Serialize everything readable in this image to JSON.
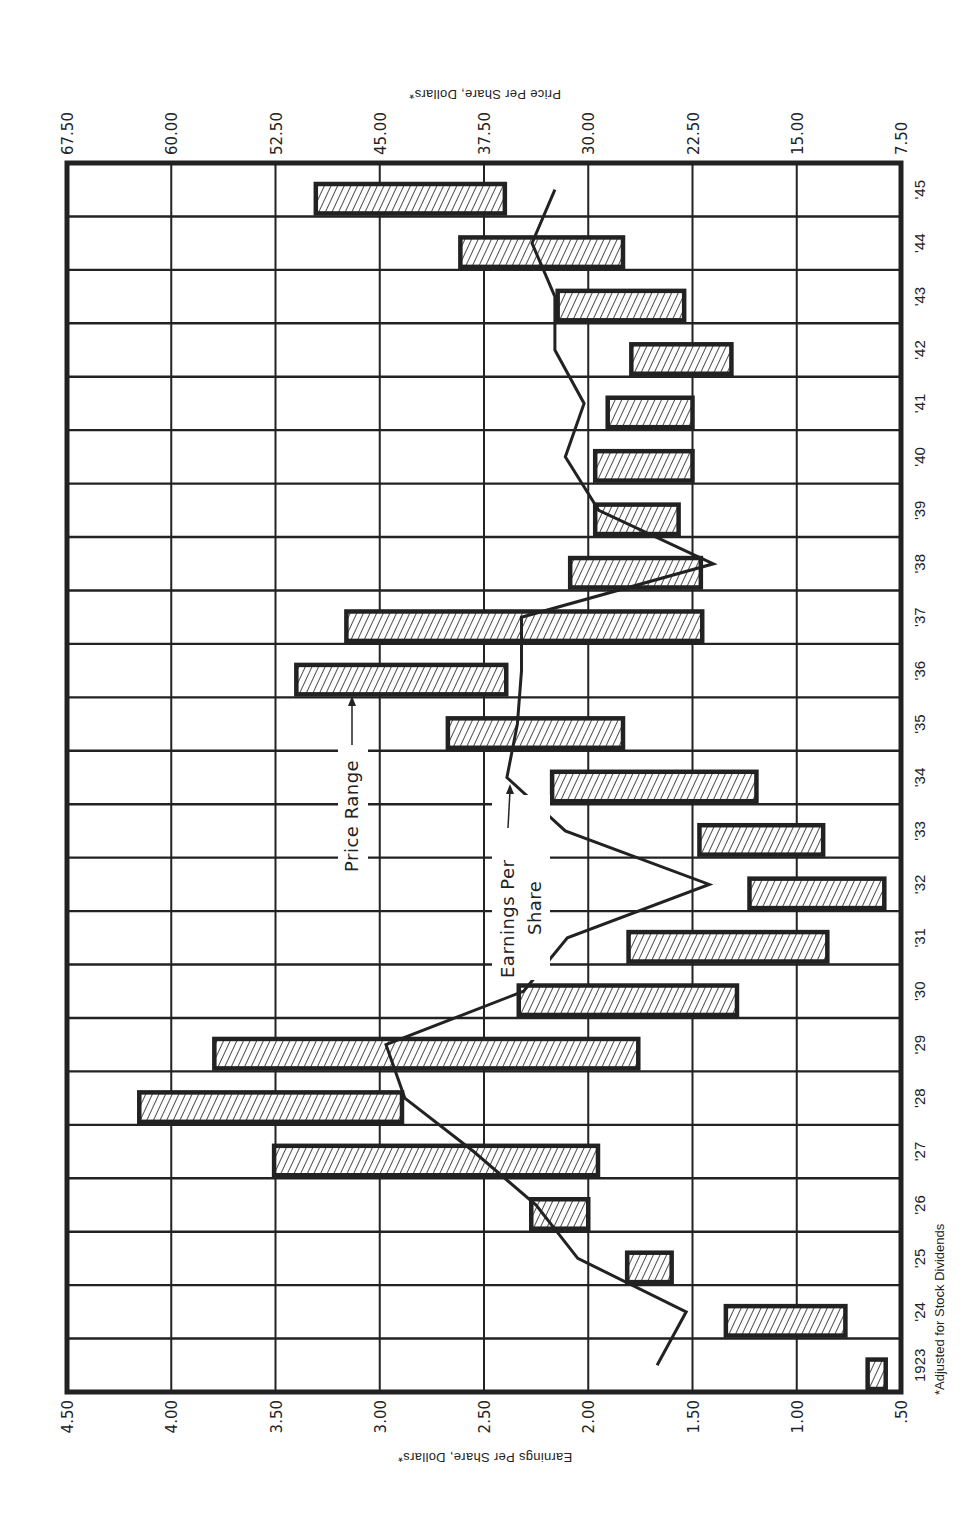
{
  "chart_data": {
    "type": "bar",
    "subtype": "floating-range-bars-with-line",
    "orientation": "rotated-90-clockwise",
    "title": "",
    "categories": [
      "1923",
      "'24",
      "'25",
      "'26",
      "'27",
      "'28",
      "'29",
      "'30",
      "'31",
      "'32",
      "'33",
      "'34",
      "'35",
      "'36",
      "'37",
      "'38",
      "'39",
      "'40",
      "'41",
      "'42",
      "'43",
      "'44",
      "'45"
    ],
    "years": [
      1923,
      1924,
      1925,
      1926,
      1927,
      1928,
      1929,
      1930,
      1931,
      1932,
      1933,
      1934,
      1935,
      1936,
      1937,
      1938,
      1939,
      1940,
      1941,
      1942,
      1943,
      1944,
      1945
    ],
    "series": [
      {
        "name": "Price Range",
        "type": "range-bar",
        "axis": "price",
        "low": [
          8.6,
          11.5,
          24.0,
          30.0,
          29.3,
          43.4,
          26.4,
          19.3,
          12.8,
          8.7,
          13.1,
          17.9,
          27.5,
          35.9,
          21.8,
          21.9,
          23.5,
          22.5,
          22.5,
          19.7,
          23.1,
          27.5,
          36.0
        ],
        "high": [
          9.9,
          20.1,
          27.2,
          34.1,
          52.6,
          62.3,
          56.9,
          35.0,
          27.1,
          18.4,
          22.0,
          32.6,
          40.1,
          51.0,
          47.4,
          31.3,
          29.5,
          29.5,
          28.6,
          26.9,
          32.2,
          39.2,
          49.6
        ]
      },
      {
        "name": "Earnings Per Share",
        "type": "line",
        "axis": "earnings",
        "values": [
          1.67,
          1.53,
          2.05,
          2.25,
          2.55,
          2.88,
          2.97,
          2.31,
          2.1,
          1.42,
          2.11,
          2.39,
          2.34,
          2.32,
          2.32,
          1.4,
          1.95,
          2.11,
          2.02,
          2.16,
          2.16,
          2.27,
          2.16
        ]
      }
    ],
    "earnings_axis": {
      "label": "Earnings Per Share, Dollars*",
      "ticks": [
        "4.50",
        "4.00",
        "3.50",
        "3.00",
        "2.50",
        "2.00",
        "1.50",
        "1.00",
        ".50"
      ],
      "range": [
        4.5,
        0.5
      ]
    },
    "price_axis": {
      "label": "Price Per Share, Dollars*",
      "ticks": [
        "67.50",
        "60.00",
        "52.50",
        "45.00",
        "37.50",
        "30.00",
        "22.50",
        "15.00",
        "7.50"
      ],
      "range": [
        67.5,
        7.5
      ]
    },
    "annotations": {
      "price_range": "Price Range",
      "earnings_line1": "Earnings Per",
      "earnings_line2": "Share"
    },
    "footnote": "*Adjusted for Stock Dividends",
    "grid": true,
    "legend": "inline arrows"
  },
  "colors": {
    "ink": "#222222",
    "hatch_bg": "#ffffff",
    "background": "#ffffff"
  }
}
